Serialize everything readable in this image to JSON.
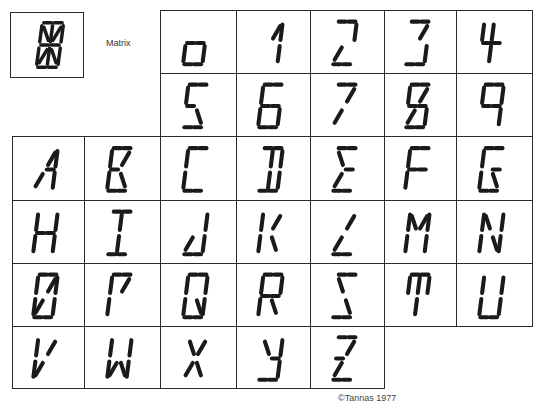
{
  "matrix": {
    "label": "Matrix",
    "segments": [
      "a1",
      "a2",
      "b",
      "c",
      "d1",
      "d2",
      "e",
      "f",
      "g1",
      "g2",
      "h",
      "i",
      "j",
      "k",
      "l",
      "m"
    ]
  },
  "copyright": "©Tannas 1977",
  "grid": {
    "col_x": [
      12,
      84,
      160,
      236,
      310,
      384,
      456,
      532
    ],
    "row_y": [
      10,
      73,
      136,
      200,
      263,
      326,
      388
    ],
    "cells": [
      {
        "char": "0",
        "row": 0,
        "col": 2,
        "segs": [
          "g1",
          "g2",
          "c",
          "d1",
          "d2",
          "e"
        ],
        "dy": 14
      },
      {
        "char": "1",
        "row": 0,
        "col": 3,
        "segs": [
          "j",
          "b",
          "c"
        ]
      },
      {
        "char": "2",
        "row": 0,
        "col": 4,
        "segs": [
          "a1",
          "a2",
          "b",
          "k",
          "d1",
          "d2"
        ]
      },
      {
        "char": "3",
        "row": 0,
        "col": 5,
        "segs": [
          "a1",
          "a2",
          "j",
          "c",
          "d1",
          "d2"
        ]
      },
      {
        "char": "4",
        "row": 0,
        "col": 6,
        "segs": [
          "f",
          "g1",
          "g2",
          "i",
          "l"
        ]
      },
      {
        "char": "5",
        "row": 1,
        "col": 2,
        "segs": [
          "a1",
          "a2",
          "f",
          "g1",
          "m",
          "d1",
          "d2"
        ]
      },
      {
        "char": "6",
        "row": 1,
        "col": 3,
        "segs": [
          "a1",
          "a2",
          "f",
          "e",
          "g1",
          "g2",
          "c",
          "d1",
          "d2"
        ]
      },
      {
        "char": "7",
        "row": 1,
        "col": 4,
        "segs": [
          "a1",
          "a2",
          "j",
          "k"
        ]
      },
      {
        "char": "8",
        "row": 1,
        "col": 5,
        "segs": [
          "a1",
          "a2",
          "f",
          "j",
          "g1",
          "g2",
          "k",
          "c",
          "d1",
          "d2"
        ]
      },
      {
        "char": "9",
        "row": 1,
        "col": 6,
        "segs": [
          "a1",
          "a2",
          "f",
          "b",
          "g1",
          "g2",
          "c"
        ]
      },
      {
        "char": "A",
        "row": 2,
        "col": 0,
        "segs": [
          "j",
          "b",
          "g2",
          "c",
          "k"
        ]
      },
      {
        "char": "B",
        "row": 2,
        "col": 1,
        "segs": [
          "a1",
          "a2",
          "f",
          "j",
          "g1",
          "e",
          "m",
          "d1",
          "d2"
        ]
      },
      {
        "char": "C",
        "row": 2,
        "col": 2,
        "segs": [
          "a1",
          "a2",
          "f",
          "e",
          "d1",
          "d2"
        ]
      },
      {
        "char": "D",
        "row": 2,
        "col": 3,
        "segs": [
          "a1",
          "a2",
          "b",
          "c",
          "i",
          "l",
          "d1",
          "d2"
        ]
      },
      {
        "char": "E",
        "row": 2,
        "col": 4,
        "segs": [
          "a1",
          "a2",
          "h",
          "g2",
          "k",
          "d1",
          "d2"
        ]
      },
      {
        "char": "F",
        "row": 2,
        "col": 5,
        "segs": [
          "a1",
          "a2",
          "f",
          "g1",
          "g2",
          "e"
        ]
      },
      {
        "char": "G",
        "row": 2,
        "col": 6,
        "segs": [
          "a1",
          "a2",
          "f",
          "e",
          "g2",
          "m",
          "d1",
          "d2"
        ]
      },
      {
        "char": "H",
        "row": 3,
        "col": 0,
        "segs": [
          "f",
          "e",
          "g1",
          "g2",
          "b",
          "c"
        ]
      },
      {
        "char": "I",
        "row": 3,
        "col": 1,
        "segs": [
          "a1",
          "a2",
          "i",
          "l",
          "d1",
          "d2"
        ]
      },
      {
        "char": "J",
        "row": 3,
        "col": 2,
        "segs": [
          "b",
          "c",
          "k",
          "d1",
          "d2"
        ]
      },
      {
        "char": "K",
        "row": 3,
        "col": 3,
        "segs": [
          "f",
          "e",
          "j",
          "m"
        ]
      },
      {
        "char": "L",
        "row": 3,
        "col": 4,
        "segs": [
          "j",
          "k",
          "d1",
          "d2"
        ]
      },
      {
        "char": "M",
        "row": 3,
        "col": 5,
        "segs": [
          "f",
          "e",
          "h",
          "j",
          "b",
          "c"
        ]
      },
      {
        "char": "N",
        "row": 3,
        "col": 6,
        "segs": [
          "f",
          "e",
          "h",
          "m",
          "b",
          "c"
        ]
      },
      {
        "char": "O",
        "row": 4,
        "col": 0,
        "segs": [
          "a1",
          "a2",
          "f",
          "b",
          "j",
          "k",
          "e",
          "c",
          "d1",
          "d2"
        ]
      },
      {
        "char": "P",
        "row": 4,
        "col": 1,
        "segs": [
          "a1",
          "a2",
          "f",
          "j",
          "e"
        ]
      },
      {
        "char": "Q",
        "row": 4,
        "col": 2,
        "segs": [
          "a1",
          "a2",
          "f",
          "b",
          "e",
          "c",
          "m",
          "d1",
          "d2"
        ]
      },
      {
        "char": "R",
        "row": 4,
        "col": 3,
        "segs": [
          "a1",
          "a2",
          "f",
          "b",
          "g1",
          "g2",
          "e",
          "m"
        ]
      },
      {
        "char": "S",
        "row": 4,
        "col": 4,
        "segs": [
          "a1",
          "a2",
          "h",
          "m",
          "d1",
          "d2"
        ]
      },
      {
        "char": "T",
        "row": 4,
        "col": 5,
        "segs": [
          "a1",
          "a2",
          "f",
          "b",
          "i",
          "l"
        ]
      },
      {
        "char": "U",
        "row": 4,
        "col": 6,
        "segs": [
          "f",
          "e",
          "b",
          "c",
          "d1",
          "d2"
        ]
      },
      {
        "char": "V",
        "row": 5,
        "col": 0,
        "segs": [
          "f",
          "e",
          "j",
          "k"
        ]
      },
      {
        "char": "W",
        "row": 5,
        "col": 1,
        "segs": [
          "f",
          "e",
          "b",
          "c",
          "k",
          "m"
        ]
      },
      {
        "char": "X",
        "row": 5,
        "col": 2,
        "segs": [
          "h",
          "j",
          "k",
          "m"
        ]
      },
      {
        "char": "Y",
        "row": 5,
        "col": 3,
        "segs": [
          "h",
          "b",
          "g2",
          "c",
          "d1",
          "d2"
        ]
      },
      {
        "char": "Z",
        "row": 5,
        "col": 4,
        "segs": [
          "a1",
          "a2",
          "j",
          "g1",
          "k",
          "d1",
          "d2"
        ]
      }
    ]
  }
}
